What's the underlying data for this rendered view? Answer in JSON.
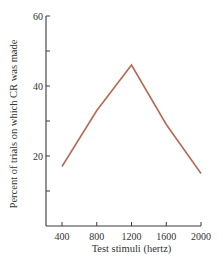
{
  "chart_data": {
    "type": "line",
    "title": "",
    "xlabel": "Test stimuli (hertz)",
    "ylabel": "Percent of trials on which CR was made",
    "x": [
      400,
      800,
      1200,
      1600,
      2000
    ],
    "series": [
      {
        "name": "CR percent",
        "values": [
          17,
          33,
          46,
          29,
          15
        ],
        "color": "#b86a52"
      }
    ],
    "xticks": [
      400,
      800,
      1200,
      1600,
      2000
    ],
    "xtick_labels": [
      "400",
      "800",
      "1200",
      "1600",
      "2000"
    ],
    "yticks": [
      10,
      20,
      30,
      40,
      50,
      60
    ],
    "ytick_labels": [
      "",
      "20",
      "",
      "40",
      "",
      "60"
    ],
    "xlim": [
      270,
      2000
    ],
    "ylim": [
      0,
      60
    ],
    "grid": false,
    "legend": "none"
  }
}
